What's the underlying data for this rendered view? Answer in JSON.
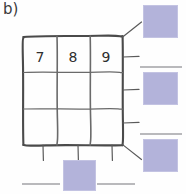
{
  "page": {
    "width": 186,
    "height": 194,
    "background_color": "#fefefe",
    "item_label": "b)"
  },
  "grid": {
    "name": "hand-drawn-3x3-grid",
    "rows": 3,
    "columns": 3,
    "stroke_color": "#4a4a4a",
    "bounds": {
      "x": 23,
      "y": 36,
      "width": 100,
      "height": 109
    },
    "cells": [
      {
        "row": 1,
        "col": 1,
        "value": "7"
      },
      {
        "row": 1,
        "col": 2,
        "value": "8"
      },
      {
        "row": 1,
        "col": 3,
        "value": "9"
      },
      {
        "row": 2,
        "col": 1,
        "value": ""
      },
      {
        "row": 2,
        "col": 2,
        "value": ""
      },
      {
        "row": 2,
        "col": 3,
        "value": ""
      },
      {
        "row": 3,
        "col": 1,
        "value": ""
      },
      {
        "row": 3,
        "col": 2,
        "value": ""
      },
      {
        "row": 3,
        "col": 3,
        "value": ""
      }
    ],
    "filled_values": [
      "7",
      "8",
      "9"
    ]
  },
  "tick_marks": {
    "right_side_count": 3,
    "bottom_side_count": 3,
    "diagonal_leader_count": 2,
    "stroke_color": "#5a5a5a"
  },
  "answer_boxes": [
    {
      "id": "answer-box-right-top",
      "position": "right-top",
      "value": "",
      "color": "#b3b3da",
      "x": 143,
      "y": 5,
      "width": 35,
      "height": 33,
      "has_rule_above": false
    },
    {
      "id": "answer-box-right-middle",
      "position": "right-middle",
      "value": "",
      "color": "#b3b3da",
      "x": 143,
      "y": 72,
      "width": 35,
      "height": 33,
      "has_rule_above": true
    },
    {
      "id": "answer-box-right-bottom",
      "position": "right-bottom",
      "value": "",
      "color": "#b3b3da",
      "x": 143,
      "y": 139,
      "width": 35,
      "height": 33,
      "has_rule_above": true
    },
    {
      "id": "answer-box-bottom-center",
      "position": "bottom-center",
      "value": "",
      "color": "#b3b3da",
      "x": 63,
      "y": 160,
      "width": 33,
      "height": 31,
      "has_rule_above": false
    }
  ],
  "answer_rules": [
    {
      "id": "rule-right-middle",
      "x": 140,
      "y": 66,
      "width": 42
    },
    {
      "id": "rule-right-bottom",
      "x": 140,
      "y": 133,
      "width": 42
    },
    {
      "id": "rule-bottom-left",
      "x": 22,
      "y": 183,
      "width": 38
    },
    {
      "id": "rule-bottom-right",
      "x": 97,
      "y": 183,
      "width": 38
    }
  ],
  "colors": {
    "swatch_fill": "#b3b3da",
    "swatch_border": "#c3c3e2",
    "ink": "#4a4a4a",
    "rule": "#b9b9bc",
    "paper": "#fefefe"
  }
}
